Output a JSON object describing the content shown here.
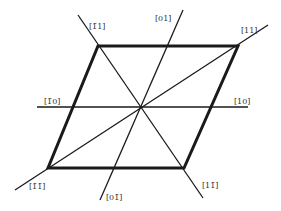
{
  "diagram": {
    "colors": {
      "line": "#1a1a1a",
      "label": "#333333",
      "background": "#ffffff"
    },
    "parallelogram": {
      "vertices": [
        [
          98,
          46
        ],
        [
          238,
          46
        ],
        [
          184,
          168
        ],
        [
          48,
          168
        ]
      ]
    },
    "center": [
      141,
      107
    ],
    "axes": [
      {
        "id": "h",
        "from": [
          37,
          107
        ],
        "to": [
          248,
          107
        ]
      },
      {
        "id": "01",
        "from": [
          183,
          10
        ],
        "to": [
          100,
          200
        ]
      },
      {
        "id": "11",
        "from": [
          268,
          25
        ],
        "to": [
          15,
          190
        ]
      },
      {
        "id": "m11",
        "from": [
          78,
          15
        ],
        "to": [
          203,
          198
        ]
      }
    ],
    "labels": {
      "m1_1": "[1̄1]",
      "0_1": "[01]",
      "1_1": "[11]",
      "m1_0": "[1̄0]",
      "1_0": "[10]",
      "m1_m1": "[1̄1̄]",
      "0_m1": "[01̄]",
      "1_m1": "[11̄]"
    }
  }
}
